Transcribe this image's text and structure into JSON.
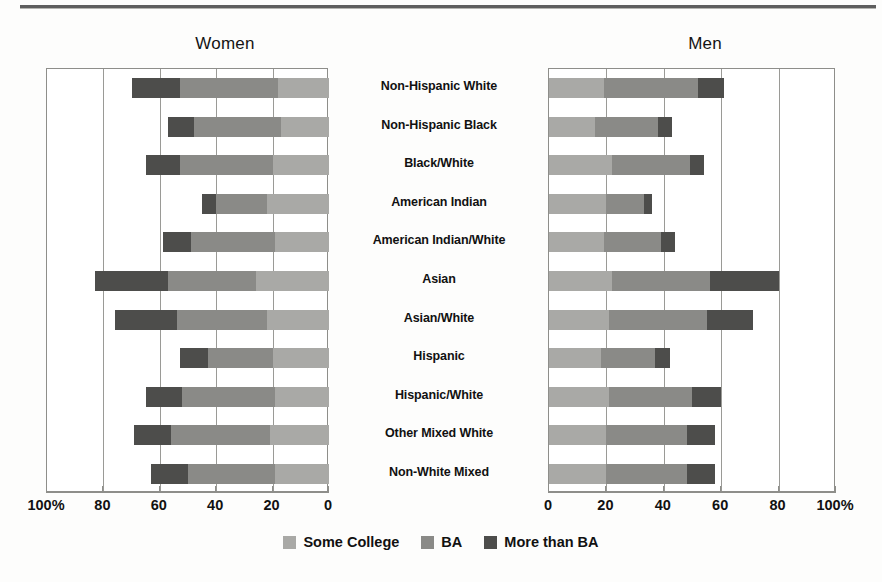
{
  "figure": {
    "panels": [
      {
        "key": "women",
        "title": "Women"
      },
      {
        "key": "men",
        "title": "Men"
      }
    ],
    "legend": [
      {
        "label": "Some College",
        "color": "#a9a9a6",
        "swatch_name": "legend-swatch-some-college"
      },
      {
        "label": "BA",
        "color": "#8a8a87",
        "swatch_name": "legend-swatch-ba"
      },
      {
        "label": "More than BA",
        "color": "#4d4d4b",
        "swatch_name": "legend-swatch-more-than-ba"
      }
    ],
    "axis_women_ticks": [
      "100%",
      "80",
      "60",
      "40",
      "20",
      "0"
    ],
    "axis_men_ticks": [
      "0",
      "20",
      "40",
      "60",
      "80",
      "100%"
    ]
  },
  "chart_data": {
    "type": "bar",
    "orientation": "horizontal",
    "stacked": true,
    "title": "",
    "subtitle": "",
    "xlabel": "",
    "ylabel": "",
    "grid": true,
    "legend_position": "bottom-center",
    "note": "Mirrored back-to-back stacked horizontal bars. Left panel (Women) axis runs 100% at left to 0 at right; right panel (Men) axis runs 0 at left to 100% at right. Values are percent of group with at least the given education level, stacked as Some College + BA + More than BA.",
    "categories": [
      "Non-Hispanic White",
      "Non-Hispanic Black",
      "Black/White",
      "American Indian",
      "American Indian/White",
      "Asian",
      "Asian/White",
      "Hispanic",
      "Hispanic/White",
      "Other Mixed White",
      "Non-White Mixed"
    ],
    "panels": [
      {
        "name": "Women",
        "axis_reversed": true,
        "xlim": [
          0,
          100
        ],
        "series": [
          {
            "name": "Some College",
            "color": "#a9a9a6",
            "values": [
              18,
              17,
              20,
              22,
              19,
              26,
              22,
              20,
              19,
              21,
              19
            ]
          },
          {
            "name": "BA",
            "color": "#8a8a87",
            "values": [
              35,
              31,
              33,
              18,
              30,
              31,
              32,
              23,
              33,
              35,
              31
            ]
          },
          {
            "name": "More than BA",
            "color": "#4d4d4b",
            "values": [
              17,
              9,
              12,
              5,
              10,
              26,
              22,
              10,
              13,
              13,
              13
            ]
          }
        ],
        "totals": [
          70,
          57,
          65,
          45,
          59,
          83,
          76,
          53,
          65,
          69,
          63
        ]
      },
      {
        "name": "Men",
        "axis_reversed": false,
        "xlim": [
          0,
          100
        ],
        "series": [
          {
            "name": "Some College",
            "color": "#a9a9a6",
            "values": [
              19,
              16,
              22,
              20,
              19,
              22,
              21,
              18,
              21,
              20,
              20
            ]
          },
          {
            "name": "BA",
            "color": "#8a8a87",
            "values": [
              33,
              22,
              27,
              13,
              20,
              34,
              34,
              19,
              29,
              28,
              28
            ]
          },
          {
            "name": "More than BA",
            "color": "#4d4d4b",
            "values": [
              9,
              5,
              5,
              3,
              5,
              24,
              16,
              5,
              10,
              10,
              10
            ]
          }
        ],
        "totals": [
          61,
          43,
          54,
          36,
          44,
          80,
          71,
          42,
          60,
          58,
          58
        ]
      }
    ]
  }
}
